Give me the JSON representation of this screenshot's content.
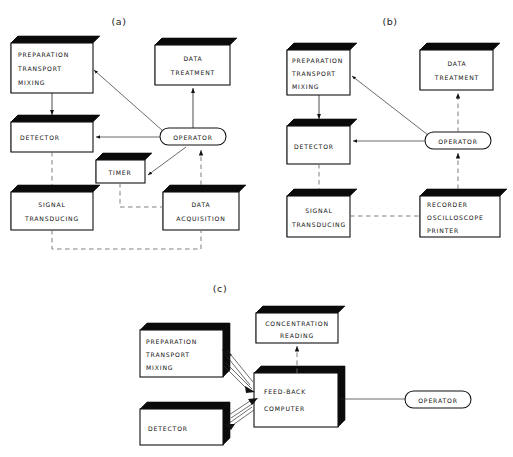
{
  "figure": {
    "panels": [
      {
        "id": "a",
        "label": "(a)",
        "nodes": {
          "preparation": "PREPARATION\nTRANSPORT\nMIXING",
          "preparation_lines": [
            "PREPARATION",
            "TRANSPORT",
            "MIXING"
          ],
          "detector": "DETECTOR",
          "signal": [
            "SIGNAL",
            "TRANSDUCING"
          ],
          "data_treatment": [
            "DATA",
            "TREATMENT"
          ],
          "operator": "OPERATOR",
          "timer": "TIMER",
          "data_acquisition": [
            "DATA",
            "ACQUISITION"
          ]
        }
      },
      {
        "id": "b",
        "label": "(b)",
        "nodes": {
          "preparation_lines": [
            "PREPARATION",
            "TRANSPORT",
            "MIXING"
          ],
          "detector": "DETECTOR",
          "signal": [
            "SIGNAL",
            "TRANSDUCING"
          ],
          "data_treatment": [
            "DATA",
            "TREATMENT"
          ],
          "operator": "OPERATOR",
          "recorder": [
            "RECORDER",
            "OSCILLOSCOPE",
            "PRINTER"
          ]
        }
      },
      {
        "id": "c",
        "label": "(c)",
        "nodes": {
          "preparation_lines": [
            "PREPARATION",
            "TRANSPORT",
            "MIXING"
          ],
          "detector": "DETECTOR",
          "concentration": [
            "CONCENTRATION",
            "READING"
          ],
          "feedback": [
            "FEED-BACK",
            "COMPUTER"
          ],
          "operator": "OPERATOR"
        }
      }
    ],
    "colors": {
      "ink": "#111111",
      "shade": "#0a0a0a",
      "dashed": "#6f6f6f",
      "page": "#ffffff"
    }
  }
}
